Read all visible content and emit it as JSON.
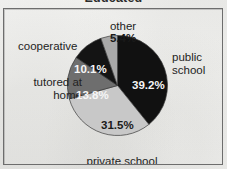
{
  "chart_data": {
    "type": "pie",
    "title": "Educated",
    "title_note": "cropped at top edge of image",
    "xlabel": "",
    "ylabel": "",
    "grid": false,
    "legend": "none-labels-placed-around-pie",
    "start_angle_deg": 0,
    "direction": "clockwise",
    "categories": [
      "public school",
      "private school",
      "tutored at home",
      "cooperative",
      "other"
    ],
    "values": [
      39.2,
      31.5,
      13.8,
      10.1,
      5.4
    ],
    "value_labels": [
      "39.2%",
      "31.5%",
      "13.8%",
      "10.1%",
      "5.4%"
    ],
    "slice_colors": [
      "#111111",
      "#c8c8c8",
      "#6e6e6e",
      "#141414",
      "#a9a9a9"
    ],
    "value_label_colors": [
      "#f6f6f6",
      "#1a1a1a",
      "#f6f6f6",
      "#f6f6f6",
      "#1a1a1a"
    ],
    "slices": [
      {
        "label": "public school",
        "value": 39.2,
        "value_label": "39.2%",
        "color": "#111111",
        "label_color": "#f6f6f6"
      },
      {
        "label": "private school",
        "value": 31.5,
        "value_label": "31.5%",
        "color": "#c8c8c8",
        "label_color": "#1a1a1a"
      },
      {
        "label": "tutored at home",
        "value": 13.8,
        "value_label": "13.8%",
        "color": "#6e6e6e",
        "label_color": "#f6f6f6"
      },
      {
        "label": "cooperative",
        "value": 10.1,
        "value_label": "10.1%",
        "color": "#141414",
        "label_color": "#f6f6f6"
      },
      {
        "label": "other",
        "value": 5.4,
        "value_label": "5.4%",
        "color": "#a9a9a9",
        "label_color": "#1a1a1a"
      }
    ]
  },
  "labels": {
    "other": "other",
    "cooperative": "cooperative",
    "tutored_at_home": "tutored at\nhome",
    "public_school": "public\nschool",
    "private_school": "private school"
  },
  "percentages": {
    "other": "5.4%",
    "cooperative": "10.1%",
    "tutored_at_home": "13.8%",
    "public_school": "39.2%",
    "private_school": "31.5%"
  },
  "colors": {
    "background": "#f2f2f0",
    "frame_border": "#6d6d6d",
    "text": "#232323",
    "slice_black": "#111111",
    "slice_dark_gray": "#6e6e6e",
    "slice_mid_gray": "#a9a9a9",
    "slice_light_gray": "#c8c8c8"
  }
}
